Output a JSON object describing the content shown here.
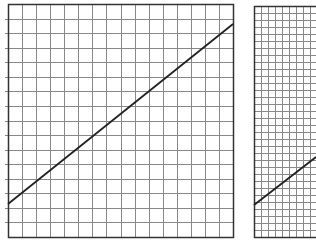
{
  "panels": [
    {
      "id": "left",
      "frame": {
        "x": 8,
        "y": 4,
        "width": 225,
        "height": 233
      },
      "grid": {
        "cols": 16,
        "rows": 16
      },
      "line": {
        "x1": 8,
        "y1": 204,
        "x2": 233,
        "y2": 24
      },
      "left_ticks": true
    },
    {
      "id": "right",
      "frame": {
        "x": 254,
        "y": 6,
        "width": 70,
        "height": 231
      },
      "grid": {
        "cols": 10,
        "rows": 33
      },
      "line": {
        "x1": 254,
        "y1": 205,
        "x2": 316,
        "y2": 157
      },
      "left_ticks": false
    }
  ],
  "colors": {
    "frame": "#333333",
    "grid": "#888888",
    "line": "#222222",
    "background": "#ffffff"
  }
}
